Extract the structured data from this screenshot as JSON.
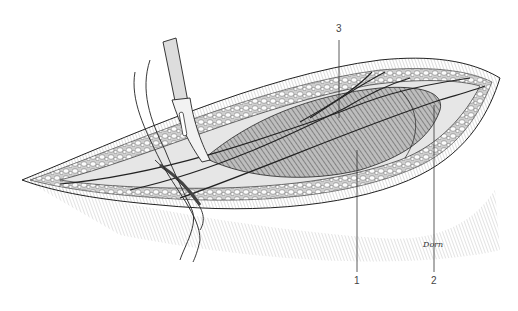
{
  "figure": {
    "colors": {
      "ink": "#222222",
      "hatch": "#777777",
      "fat": "#f4f4f4",
      "muscle": "#9a9a9a",
      "background": "#ffffff"
    },
    "labels": [
      {
        "id": "3",
        "text": "3",
        "x": 339,
        "y": 30,
        "line": [
          339,
          40,
          339,
          118
        ]
      },
      {
        "id": "1",
        "text": "1",
        "x": 357,
        "y": 280,
        "line": [
          357,
          150,
          357,
          272
        ]
      },
      {
        "id": "2",
        "text": "2",
        "x": 434,
        "y": 280,
        "line": [
          434,
          105,
          434,
          272
        ]
      }
    ],
    "signature": "Dorn"
  }
}
